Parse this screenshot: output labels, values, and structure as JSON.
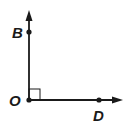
{
  "diagram": {
    "type": "right-angle",
    "points": [
      {
        "id": "B",
        "label": "B"
      },
      {
        "id": "O",
        "label": "O"
      },
      {
        "id": "D",
        "label": "D"
      }
    ],
    "rays": [
      "OB",
      "OD"
    ],
    "angle": {
      "vertex": "O",
      "marker": "right-angle-square"
    },
    "colors": {
      "stroke": "#1a1a1a",
      "background": "#ffffff"
    }
  }
}
